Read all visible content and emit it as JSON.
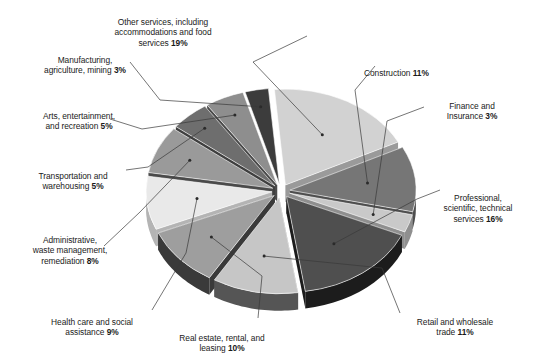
{
  "chart_data": {
    "type": "pie",
    "title": "",
    "subtitle": "",
    "xlabel": "",
    "ylabel": "",
    "legend_position": "none",
    "grid": false,
    "exploded": true,
    "three_d": true,
    "value_unit": "percent",
    "categories": [
      "Other services, including accommodations and food services",
      "Construction",
      "Finance and Insurance",
      "Professional, scientific, technical services",
      "Retail and wholesale trade",
      "Real estate, rental, and leasing",
      "Health care and social assistance",
      "Administrative, waste management, remediation",
      "Transportation and warehousing",
      "Arts, entertainment, and recreation",
      "Manufacturing, agriculture, mining"
    ],
    "values": [
      19,
      11,
      3,
      16,
      11,
      10,
      9,
      8,
      5,
      5,
      3
    ],
    "colors": [
      "#d2d2d2",
      "#767676",
      "#c9c9c9",
      "#4f4f4f",
      "#c6c6c6",
      "#9e9e9e",
      "#e9e9e9",
      "#9a9a9a",
      "#6e6e6e",
      "#8e8e8e",
      "#3c3c3c"
    ],
    "side_colors": [
      "#9a9a9a",
      "#4e4e4e",
      "#8f8f8f",
      "#1c1c1c",
      "#555555",
      "#3a3a3a",
      "#b4b4b4",
      "#4a4a4a",
      "#3f3f3f",
      "#4a4a4a",
      "#1a1a1a"
    ]
  },
  "labels": [
    {
      "name": "other-services",
      "text": "Other services, including\naccommodations and food\nservices ",
      "pct": "19%"
    },
    {
      "name": "construction",
      "text": "Construction ",
      "pct": "11%"
    },
    {
      "name": "finance-insurance",
      "text": "Finance and\nInsurance ",
      "pct": "3%"
    },
    {
      "name": "professional-services",
      "text": "Professional,\nscientific, technical\nservices ",
      "pct": "16%"
    },
    {
      "name": "retail-wholesale",
      "text": "Retail and wholesale\ntrade ",
      "pct": "11%"
    },
    {
      "name": "real-estate",
      "text": "Real estate, rental, and\nleasing  ",
      "pct": "10%"
    },
    {
      "name": "health-care",
      "text": "Health care and social\nassistance ",
      "pct": "9%"
    },
    {
      "name": "administrative",
      "text": "Administrative,\nwaste management,\nremediation ",
      "pct": "8%"
    },
    {
      "name": "transportation",
      "text": "Transportation and\nwarehousing ",
      "pct": "5%"
    },
    {
      "name": "arts-entertainment",
      "text": "Arts, entertainment,\nand recreation ",
      "pct": "5%"
    },
    {
      "name": "manufacturing",
      "text": "Manufacturing,\nagriculture, mining ",
      "pct": "3%"
    }
  ]
}
